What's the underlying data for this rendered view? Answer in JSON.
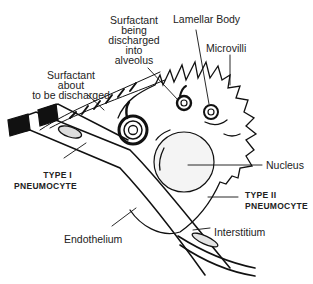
{
  "diagram": {
    "labels": {
      "surfactant_being_discharged": [
        "Surfactant",
        "being",
        "discharged",
        "into",
        "alveolus"
      ],
      "lamellar_body": "Lamellar Body",
      "microvilli": "Microvilli",
      "surfactant_about_to_be_discharged": [
        "Surfactant",
        "about",
        "to be discharged"
      ],
      "nucleus": "Nucleus",
      "type_i_pneumocyte": [
        "TYPE I",
        "PNEUMOCYTE"
      ],
      "type_ii_pneumocyte": [
        "TYPE II",
        "PNEUMOCYTE"
      ],
      "endothelium": "Endothelium",
      "interstitium": "Interstitium"
    }
  }
}
